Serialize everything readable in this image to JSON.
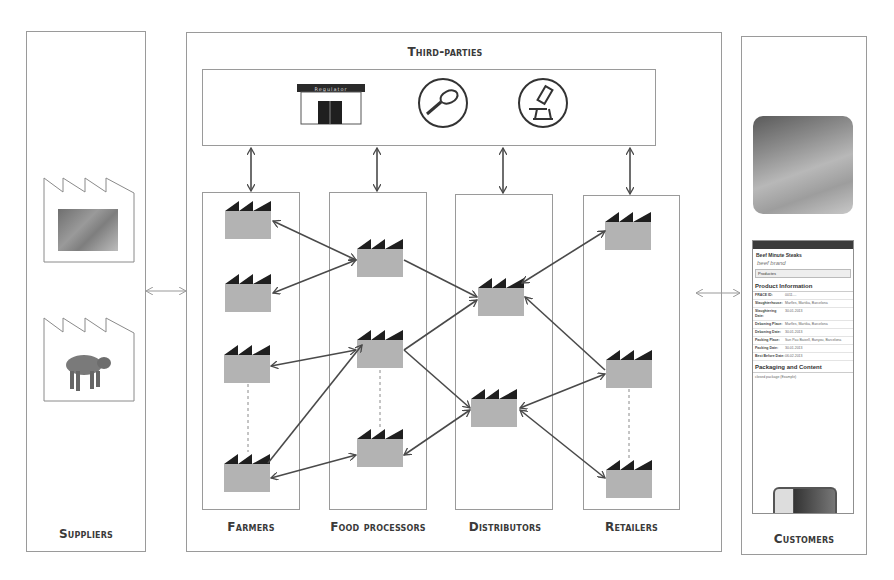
{
  "diagram": {
    "columns": {
      "suppliers": {
        "label": "Suppliers"
      },
      "third_parties": {
        "label": "Third-parties",
        "icons": [
          {
            "name": "regulator-building-icon",
            "caption": "Regulator"
          },
          {
            "name": "magnifying-glass-icon"
          },
          {
            "name": "microscope-icon"
          }
        ]
      },
      "farmers": {
        "label": "Farmers"
      },
      "food_processors": {
        "label": "Food processors"
      },
      "distributors": {
        "label": "Distributors"
      },
      "retailers": {
        "label": "Retailers"
      },
      "customers": {
        "label": "Customers"
      }
    },
    "phone": {
      "title": "Beef Minute Steaks",
      "logo": "beef brand",
      "dropdown": "Productes",
      "section1": "Product Information",
      "rows": [
        {
          "k": "FRACE ID:",
          "v": "0011...."
        },
        {
          "k": "Slaughterhouse:",
          "v": "Marfles, Martika, Barcelona"
        },
        {
          "k": "Slaughtering Date:",
          "v": "30.01.2013"
        },
        {
          "k": "Deboning Place:",
          "v": "Marfles, Martika, Barcelona"
        },
        {
          "k": "Deboning Date:",
          "v": "30.01.2013"
        },
        {
          "k": "Packing Place:",
          "v": "Sun Pau Baixell, Banyou, Barcelona"
        },
        {
          "k": "Packing Date:",
          "v": "30.01.2013"
        },
        {
          "k": "Best Before Date:",
          "v": "06.02.2013"
        }
      ],
      "section2": "Packaging and Content",
      "sub": "closed package (Example)"
    },
    "colors": {
      "factory_body": "#b3b3b3",
      "factory_roof": "#1f1f1f",
      "border": "#9a9a9a",
      "arrow": "#4a4a4a"
    }
  }
}
